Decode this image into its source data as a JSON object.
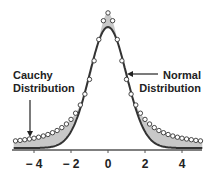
{
  "chart_data": {
    "type": "line",
    "title": "",
    "xlabel": "",
    "ylabel": "",
    "xlim": [
      -5.1,
      5.1
    ],
    "xticks": [
      -4,
      -2,
      0,
      2,
      4
    ],
    "xtick_labels": [
      "− 4",
      "− 2",
      "0",
      "2",
      "4"
    ],
    "grid": false,
    "legend": "none (inline annotations)",
    "series": [
      {
        "name": "Normal Distribution",
        "style": "solid dark line",
        "formula": "exp(-x^2/2)/sqrt(2*pi)",
        "peak": 0.399
      },
      {
        "name": "Cauchy Distribution",
        "style": "open circle markers",
        "formula": "scaled Cauchy, gamma ~ 1.0",
        "peak_relative_to_normal": 1.1,
        "x_spacing": 0.25
      }
    ],
    "fill": {
      "description": "shaded gray region between the two curves",
      "color": "#c8c8c8"
    },
    "annotations": [
      {
        "text": "Cauchy Distribution",
        "arrow": "down",
        "target_x": -4.2
      },
      {
        "text": "Normal Distribution",
        "arrow": "left",
        "target_x": 1.0
      }
    ]
  },
  "labels": {
    "cauchy_line1": "Cauchy",
    "cauchy_line2": "Distribution",
    "normal_line1": "Normal",
    "normal_line2": "Distribution"
  },
  "ticks": [
    "− 4",
    "− 2",
    "0",
    "2",
    "4"
  ],
  "colors": {
    "curve": "#333333",
    "fill": "#c8c8c8",
    "marker_fill": "#ffffff",
    "marker_stroke": "#333333",
    "axis": "#555555"
  }
}
